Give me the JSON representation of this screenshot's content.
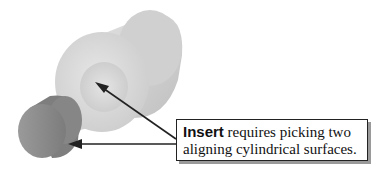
{
  "diagram": {
    "callout": {
      "keyword": "Insert",
      "line1_rest": " requires picking two",
      "line2": "aligning cylindrical surfaces."
    },
    "parts": [
      {
        "name": "large-cylinder-with-bore",
        "color": "#d6d6d6"
      },
      {
        "name": "small-cylinder-shaft",
        "color": "#8f8f8f"
      }
    ],
    "arrows": [
      {
        "from": "callout",
        "to": "bore-surface"
      },
      {
        "from": "callout",
        "to": "shaft-surface"
      }
    ]
  }
}
